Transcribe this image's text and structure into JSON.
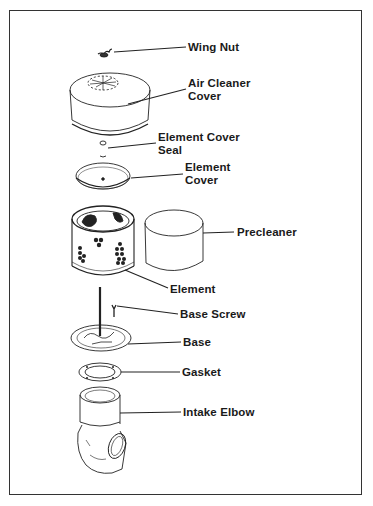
{
  "diagram": {
    "type": "exploded-parts-diagram",
    "labels": [
      {
        "id": "wing-nut",
        "lines": [
          "Wing Nut"
        ]
      },
      {
        "id": "air-cleaner-cover",
        "lines": [
          "Air Cleaner",
          "Cover"
        ]
      },
      {
        "id": "element-cover-seal",
        "lines": [
          "Element Cover",
          "Seal"
        ]
      },
      {
        "id": "element-cover",
        "lines": [
          "Element",
          "Cover"
        ]
      },
      {
        "id": "precleaner",
        "lines": [
          "Precleaner"
        ]
      },
      {
        "id": "element",
        "lines": [
          "Element"
        ]
      },
      {
        "id": "base-screw",
        "lines": [
          "Base Screw"
        ]
      },
      {
        "id": "base",
        "lines": [
          "Base"
        ]
      },
      {
        "id": "gasket",
        "lines": [
          "Gasket"
        ]
      },
      {
        "id": "intake-elbow",
        "lines": [
          "Intake Elbow"
        ]
      }
    ],
    "colors": {
      "ink": "#1a1a1a",
      "background": "#ffffff",
      "frame": "#333333"
    }
  }
}
